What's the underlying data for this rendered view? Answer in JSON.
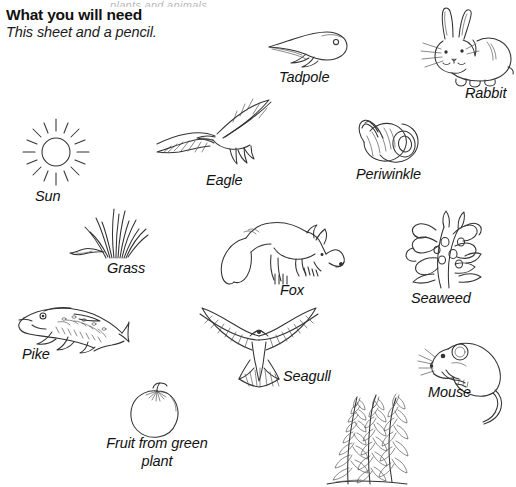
{
  "worksheet": {
    "cutoff_line": "plants and animals",
    "header_title": "What you will need",
    "header_subtitle": "This sheet and a pencil."
  },
  "organisms": [
    {
      "name": "tadpole",
      "label": "Tadpole"
    },
    {
      "name": "rabbit",
      "label": "Rabbit"
    },
    {
      "name": "sun",
      "label": "Sun"
    },
    {
      "name": "eagle",
      "label": "Eagle"
    },
    {
      "name": "periwinkle",
      "label": "Periwinkle"
    },
    {
      "name": "grass",
      "label": "Grass"
    },
    {
      "name": "fox",
      "label": "Fox"
    },
    {
      "name": "seaweed",
      "label": "Seaweed"
    },
    {
      "name": "pike",
      "label": "Pike"
    },
    {
      "name": "seagull",
      "label": "Seagull"
    },
    {
      "name": "mouse",
      "label": "Mouse"
    },
    {
      "name": "fruit",
      "label": "Fruit from green plant"
    },
    {
      "name": "pondweed",
      "label": ""
    }
  ],
  "colors": {
    "page_background": "#ffffff",
    "ink": "#333333",
    "text": "#111111"
  }
}
